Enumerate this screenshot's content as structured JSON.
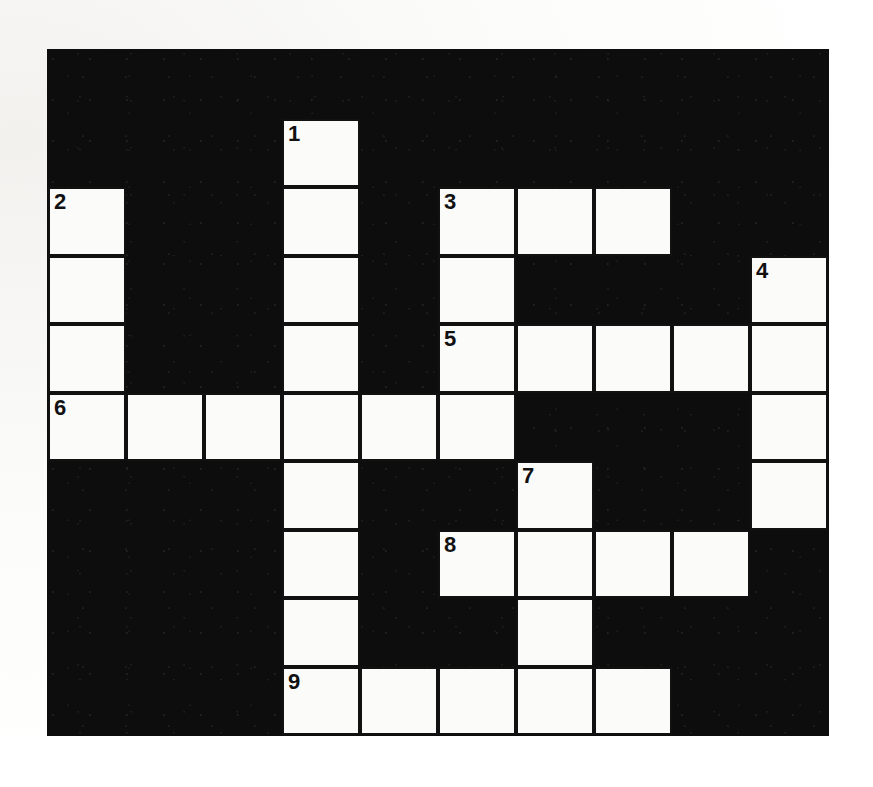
{
  "puzzle": {
    "type": "crossword-grid",
    "title": "Crossword Puzzle Grid",
    "columns": 10,
    "rows": 10,
    "cell_width": 78,
    "cell_height": 68.5,
    "origin_x": 48,
    "origin_y": 50,
    "colors": {
      "block": "#0d0d0d",
      "cell": "#fbfbfa",
      "cell_border": "#111111",
      "number": "#111111",
      "page": "#ffffff"
    },
    "clue_numbers": [
      {
        "number": "1",
        "row": 1,
        "col": 3
      },
      {
        "number": "2",
        "row": 2,
        "col": 0
      },
      {
        "number": "3",
        "row": 2,
        "col": 5
      },
      {
        "number": "4",
        "row": 3,
        "col": 9
      },
      {
        "number": "5",
        "row": 4,
        "col": 5
      },
      {
        "number": "6",
        "row": 5,
        "col": 0
      },
      {
        "number": "7",
        "row": 6,
        "col": 6
      },
      {
        "number": "8",
        "row": 7,
        "col": 5
      },
      {
        "number": "9",
        "row": 9,
        "col": 3
      }
    ],
    "white_cells": [
      {
        "row": 1,
        "col": 3
      },
      {
        "row": 2,
        "col": 0
      },
      {
        "row": 2,
        "col": 3
      },
      {
        "row": 2,
        "col": 5
      },
      {
        "row": 2,
        "col": 6
      },
      {
        "row": 2,
        "col": 7
      },
      {
        "row": 3,
        "col": 0
      },
      {
        "row": 3,
        "col": 3
      },
      {
        "row": 3,
        "col": 5
      },
      {
        "row": 3,
        "col": 9
      },
      {
        "row": 4,
        "col": 0
      },
      {
        "row": 4,
        "col": 3
      },
      {
        "row": 4,
        "col": 5
      },
      {
        "row": 4,
        "col": 6
      },
      {
        "row": 4,
        "col": 7
      },
      {
        "row": 4,
        "col": 8
      },
      {
        "row": 4,
        "col": 9
      },
      {
        "row": 5,
        "col": 0
      },
      {
        "row": 5,
        "col": 1
      },
      {
        "row": 5,
        "col": 2
      },
      {
        "row": 5,
        "col": 3
      },
      {
        "row": 5,
        "col": 4
      },
      {
        "row": 5,
        "col": 5
      },
      {
        "row": 5,
        "col": 9
      },
      {
        "row": 6,
        "col": 3
      },
      {
        "row": 6,
        "col": 6
      },
      {
        "row": 6,
        "col": 9
      },
      {
        "row": 7,
        "col": 3
      },
      {
        "row": 7,
        "col": 5
      },
      {
        "row": 7,
        "col": 6
      },
      {
        "row": 7,
        "col": 7
      },
      {
        "row": 7,
        "col": 8
      },
      {
        "row": 8,
        "col": 3
      },
      {
        "row": 8,
        "col": 6
      },
      {
        "row": 9,
        "col": 3
      },
      {
        "row": 9,
        "col": 4
      },
      {
        "row": 9,
        "col": 5
      },
      {
        "row": 9,
        "col": 6
      },
      {
        "row": 9,
        "col": 7
      }
    ],
    "entries": {
      "across": [
        {
          "number": "2",
          "row": 2,
          "col": 0,
          "length": 1
        },
        {
          "number": "3",
          "row": 2,
          "col": 5,
          "length": 3
        },
        {
          "number": "5",
          "row": 4,
          "col": 5,
          "length": 5
        },
        {
          "number": "6",
          "row": 5,
          "col": 0,
          "length": 6
        },
        {
          "number": "8",
          "row": 7,
          "col": 5,
          "length": 4
        },
        {
          "number": "9",
          "row": 9,
          "col": 3,
          "length": 5
        }
      ],
      "down": [
        {
          "number": "1",
          "row": 1,
          "col": 3,
          "length": 8
        },
        {
          "number": "2",
          "row": 2,
          "col": 0,
          "length": 4
        },
        {
          "number": "3",
          "row": 2,
          "col": 5,
          "length": 4
        },
        {
          "number": "4",
          "row": 3,
          "col": 9,
          "length": 4
        },
        {
          "number": "7",
          "row": 6,
          "col": 6,
          "length": 3
        }
      ]
    }
  }
}
